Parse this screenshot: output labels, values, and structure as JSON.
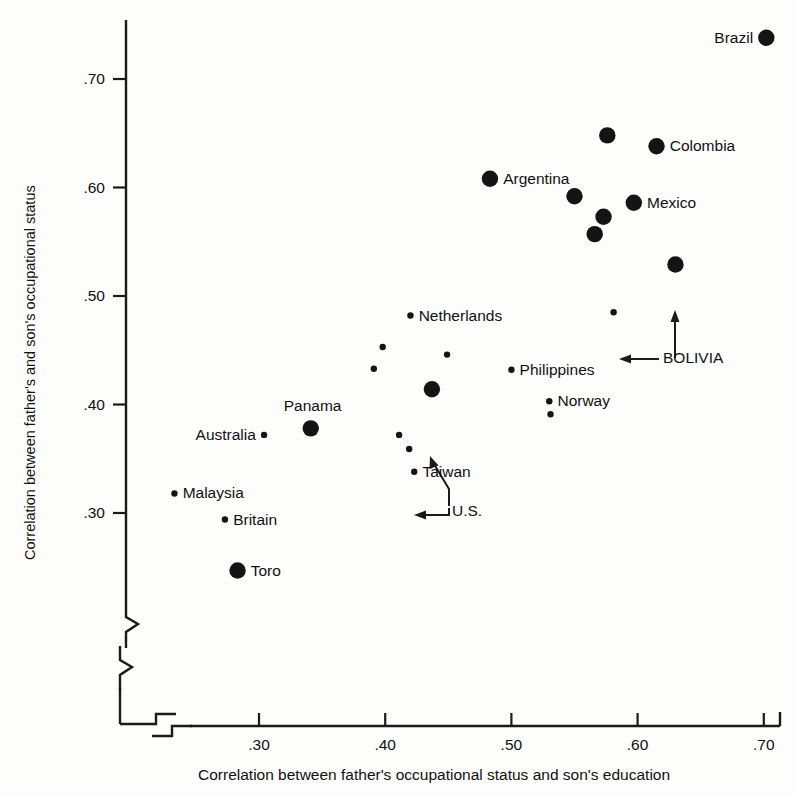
{
  "chart_data": {
    "type": "scatter",
    "title": "",
    "xlabel": "Correlation between father's occupational status and son's education",
    "ylabel": "Correlation between father's and son's occupational status",
    "xlim": [
      0.255,
      0.715
    ],
    "ylim": [
      0.255,
      0.755
    ],
    "xticks": [
      ".30",
      ".40",
      ".50",
      ".60",
      ".70"
    ],
    "xtick_values": [
      0.3,
      0.4,
      0.5,
      0.6,
      0.7
    ],
    "yticks": [
      ".30",
      ".40",
      ".50",
      ".60",
      ".70"
    ],
    "ytick_values": [
      0.3,
      0.4,
      0.5,
      0.6,
      0.7
    ],
    "grid": false,
    "legend": null,
    "axis_break": "both",
    "marker_color": "#141414",
    "points": [
      {
        "label": "Brazil",
        "x": 0.702,
        "y": 0.738,
        "size": "large",
        "label_pos": "left"
      },
      {
        "label": "",
        "x": 0.576,
        "y": 0.648,
        "size": "large",
        "label_pos": "none"
      },
      {
        "label": "Colombia",
        "x": 0.615,
        "y": 0.638,
        "size": "large",
        "label_pos": "right"
      },
      {
        "label": "Argentina",
        "x": 0.483,
        "y": 0.608,
        "size": "large",
        "label_pos": "right"
      },
      {
        "label": "",
        "x": 0.55,
        "y": 0.592,
        "size": "large",
        "label_pos": "none"
      },
      {
        "label": "Mexico",
        "x": 0.597,
        "y": 0.586,
        "size": "large",
        "label_pos": "right"
      },
      {
        "label": "",
        "x": 0.573,
        "y": 0.573,
        "size": "large",
        "label_pos": "none"
      },
      {
        "label": "",
        "x": 0.566,
        "y": 0.557,
        "size": "large",
        "label_pos": "none"
      },
      {
        "label": "BOLIVIA",
        "x": 0.63,
        "y": 0.529,
        "size": "large",
        "label_pos": "arrow-up"
      },
      {
        "label": "",
        "x": 0.581,
        "y": 0.485,
        "size": "small",
        "label_pos": "arrow-left"
      },
      {
        "label": "Netherlands",
        "x": 0.42,
        "y": 0.482,
        "size": "small",
        "label_pos": "right"
      },
      {
        "label": "",
        "x": 0.398,
        "y": 0.453,
        "size": "small",
        "label_pos": "none"
      },
      {
        "label": "",
        "x": 0.449,
        "y": 0.446,
        "size": "small",
        "label_pos": "none"
      },
      {
        "label": "",
        "x": 0.391,
        "y": 0.433,
        "size": "small",
        "label_pos": "none"
      },
      {
        "label": "Philippines",
        "x": 0.5,
        "y": 0.432,
        "size": "small",
        "label_pos": "right"
      },
      {
        "label": "U.S.",
        "x": 0.437,
        "y": 0.414,
        "size": "large",
        "label_pos": "arrow-upleft"
      },
      {
        "label": "Norway",
        "x": 0.53,
        "y": 0.403,
        "size": "small",
        "label_pos": "right"
      },
      {
        "label": "",
        "x": 0.531,
        "y": 0.391,
        "size": "small",
        "label_pos": "none"
      },
      {
        "label": "Panama",
        "x": 0.341,
        "y": 0.378,
        "size": "large",
        "label_pos": "above"
      },
      {
        "label": "Australia",
        "x": 0.304,
        "y": 0.372,
        "size": "small",
        "label_pos": "left"
      },
      {
        "label": "",
        "x": 0.411,
        "y": 0.372,
        "size": "small",
        "label_pos": "none"
      },
      {
        "label": "",
        "x": 0.419,
        "y": 0.359,
        "size": "small",
        "label_pos": "arrow-left-us"
      },
      {
        "label": "Taiwan",
        "x": 0.423,
        "y": 0.338,
        "size": "small",
        "label_pos": "right"
      },
      {
        "label": "Malaysia",
        "x": 0.233,
        "y": 0.318,
        "size": "small",
        "label_pos": "right"
      },
      {
        "label": "Britain",
        "x": 0.273,
        "y": 0.294,
        "size": "small",
        "label_pos": "right"
      },
      {
        "label": "Toro",
        "x": 0.283,
        "y": 0.247,
        "size": "large",
        "label_pos": "right"
      }
    ],
    "annotations": [
      {
        "text": "BOLIVIA",
        "targets": [
          "large dot above",
          "small dot to the left"
        ]
      },
      {
        "text": "U.S.",
        "targets": [
          "large dot up-left",
          "small dot to the left"
        ]
      }
    ]
  }
}
